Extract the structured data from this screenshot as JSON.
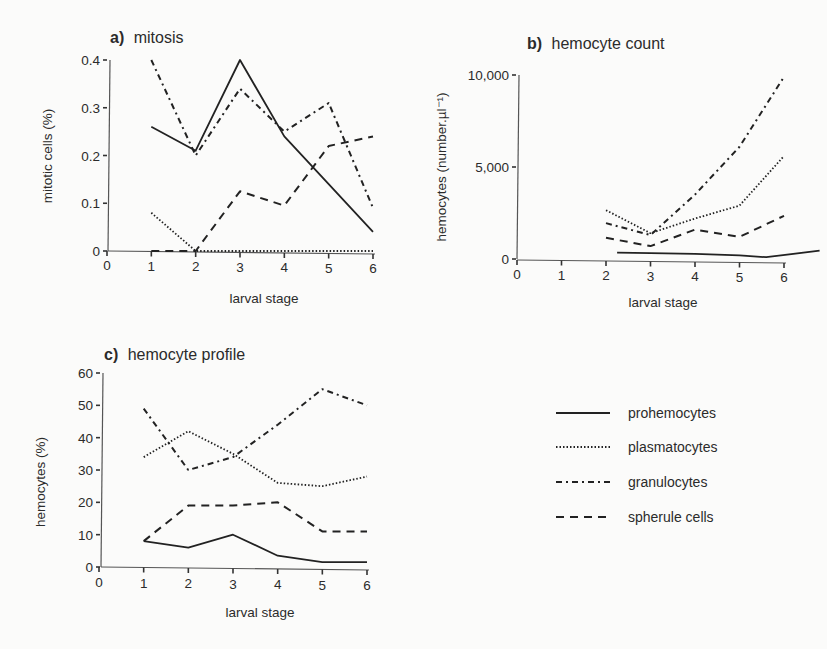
{
  "figure": {
    "legend": [
      {
        "key": "prohemocytes",
        "label": "prohemocytes",
        "style": "solid"
      },
      {
        "key": "plasmatocytes",
        "label": "plasmatocytes",
        "style": "dotted"
      },
      {
        "key": "granulocytes",
        "label": "granulocytes",
        "style": "dash-dot"
      },
      {
        "key": "spherule",
        "label": "spherule cells",
        "style": "dashed"
      }
    ]
  },
  "chart_data": [
    {
      "id": "a",
      "type": "line",
      "panel_label": "a)",
      "title": "mitosis",
      "xlabel": "larval stage",
      "ylabel": "mitotic cells (%)",
      "x_ticks": [
        "0",
        "1",
        "2",
        "3",
        "4",
        "5",
        "6"
      ],
      "y_ticks": [
        "0",
        "0.1",
        "0.2",
        "0.3",
        "0.4"
      ],
      "xlim": [
        0,
        6
      ],
      "ylim": [
        0,
        0.4
      ],
      "grid": false,
      "series": [
        {
          "name": "prohemocytes",
          "x": [
            1,
            2,
            3,
            4,
            5,
            6
          ],
          "values": [
            0.26,
            0.21,
            0.4,
            0.24,
            0.14,
            0.04
          ]
        },
        {
          "name": "plasmatocytes",
          "x": [
            1,
            2,
            3,
            4,
            5,
            6
          ],
          "values": [
            0.08,
            0.0,
            0.0,
            0.0,
            0.0,
            0.0
          ]
        },
        {
          "name": "granulocytes",
          "x": [
            1,
            2,
            3,
            4,
            5,
            6
          ],
          "values": [
            0.4,
            0.2,
            0.34,
            0.25,
            0.31,
            0.09
          ]
        },
        {
          "name": "spherule cells",
          "x": [
            1,
            2,
            3,
            4,
            5,
            6
          ],
          "values": [
            0.0,
            0.0,
            0.125,
            0.095,
            0.22,
            0.24
          ]
        }
      ]
    },
    {
      "id": "b",
      "type": "line",
      "panel_label": "b)",
      "title": "hemocyte count",
      "xlabel": "larval stage",
      "ylabel": "hemocytes (number.µl⁻¹)",
      "x_ticks": [
        "0",
        "1",
        "2",
        "3",
        "4",
        "5",
        "6"
      ],
      "y_ticks": [
        "0",
        "5,000",
        "10,000"
      ],
      "xlim": [
        0,
        6
      ],
      "ylim": [
        0,
        10000
      ],
      "grid": false,
      "series": [
        {
          "name": "prohemocytes",
          "x": [
            2.25,
            3,
            4,
            5,
            5.6,
            6.8
          ],
          "values": [
            350,
            320,
            280,
            200,
            100,
            450
          ]
        },
        {
          "name": "plasmatocytes",
          "x": [
            2,
            3,
            4,
            5,
            6
          ],
          "values": [
            2650,
            1400,
            2200,
            2900,
            5600
          ]
        },
        {
          "name": "granulocytes",
          "x": [
            2,
            3,
            4,
            5,
            6
          ],
          "values": [
            1950,
            1300,
            3500,
            6100,
            9900
          ]
        },
        {
          "name": "spherule cells",
          "x": [
            2,
            3,
            4,
            5,
            6
          ],
          "values": [
            1150,
            700,
            1600,
            1200,
            2350
          ]
        }
      ]
    },
    {
      "id": "c",
      "type": "line",
      "panel_label": "c)",
      "title": "hemocyte profile",
      "xlabel": "larval stage",
      "ylabel": "hemocytes (%)",
      "x_ticks": [
        "0",
        "1",
        "2",
        "3",
        "4",
        "5",
        "6"
      ],
      "y_ticks": [
        "0",
        "10",
        "20",
        "30",
        "40",
        "50",
        "60"
      ],
      "xlim": [
        0,
        6
      ],
      "ylim": [
        0,
        60
      ],
      "grid": false,
      "series": [
        {
          "name": "prohemocytes",
          "x": [
            1,
            2,
            3,
            4,
            5,
            6
          ],
          "values": [
            8,
            6,
            10,
            3.5,
            1.5,
            1.5
          ]
        },
        {
          "name": "plasmatocytes",
          "x": [
            1,
            2,
            3,
            4,
            5,
            6
          ],
          "values": [
            34,
            42,
            35,
            26,
            25,
            28
          ]
        },
        {
          "name": "granulocytes",
          "x": [
            1,
            2,
            3,
            4,
            5,
            6
          ],
          "values": [
            49,
            30,
            34,
            44,
            55,
            50
          ]
        },
        {
          "name": "spherule cells",
          "x": [
            1,
            2,
            3,
            4,
            5,
            6
          ],
          "values": [
            8,
            19,
            19,
            20,
            11,
            11
          ]
        }
      ],
      "legend_position": "right"
    }
  ]
}
